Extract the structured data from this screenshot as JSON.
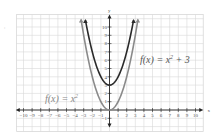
{
  "chart_data": {
    "type": "line",
    "title": "",
    "xlabel": "x",
    "ylabel": "y",
    "xlim": [
      -10,
      10
    ],
    "ylim": [
      -1,
      10
    ],
    "grid": true,
    "x_ticks": [
      -10,
      -9,
      -8,
      -7,
      -6,
      -5,
      -4,
      -3,
      -2,
      -1,
      1,
      2,
      3,
      4,
      5,
      6,
      7,
      8,
      9,
      10
    ],
    "y_ticks": [
      -1,
      1,
      2,
      3,
      4,
      5,
      6,
      7,
      8,
      9,
      10
    ],
    "series": [
      {
        "name": "f(x) = x^2",
        "label_text": "f(x) = x",
        "label_sup": "2",
        "color": "#8a8a8a",
        "vertex": [
          0,
          0
        ],
        "expr": "x^2",
        "points": [
          [
            -3.3,
            10.9
          ],
          [
            -3,
            9
          ],
          [
            -2,
            4
          ],
          [
            -1,
            1
          ],
          [
            0,
            0
          ],
          [
            1,
            1
          ],
          [
            2,
            4
          ],
          [
            3,
            9
          ],
          [
            3.3,
            10.9
          ]
        ]
      },
      {
        "name": "f(x) = x^2 + 3",
        "label_text": "f(x) = x",
        "label_sup": "2",
        "label_tail": " + 3",
        "color": "#2a2a2a",
        "vertex": [
          0,
          3
        ],
        "expr": "x^2 + 3",
        "points": [
          [
            -2.8,
            10.8
          ],
          [
            -2,
            7
          ],
          [
            -1,
            4
          ],
          [
            0,
            3
          ],
          [
            1,
            4
          ],
          [
            2,
            7
          ],
          [
            2.8,
            10.8
          ]
        ]
      }
    ],
    "legend": "inline labels"
  },
  "colors": {
    "grid": "#d8d8d8",
    "axis": "#222222",
    "curve_base": "#8a8a8a",
    "curve_shifted": "#2a2a2a",
    "text": "#555555"
  }
}
